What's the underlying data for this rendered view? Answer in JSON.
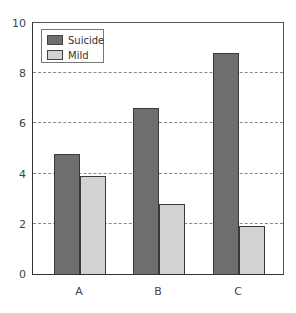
{
  "chart_data": {
    "type": "bar",
    "title": "",
    "xlabel": "",
    "ylabel": "",
    "categories": [
      "A",
      "B",
      "C"
    ],
    "series": [
      {
        "name": "Suicide",
        "values": [
          4.8,
          6.6,
          8.8
        ],
        "color": "#6e6e6e"
      },
      {
        "name": "Mild",
        "values": [
          3.9,
          2.8,
          1.9
        ],
        "color": "#d2d2d2"
      }
    ],
    "ylim": [
      0,
      10
    ],
    "yticks": [
      "0",
      "2",
      "4",
      "6",
      "8",
      "10"
    ],
    "grid": "horizontal dashed at 2,4,6,8",
    "legend_position": "upper left inside"
  },
  "legend": {
    "items": [
      {
        "label": "Suicide",
        "color": "#6e6e6e"
      },
      {
        "label": "Mild",
        "color": "#d2d2d2"
      }
    ]
  }
}
